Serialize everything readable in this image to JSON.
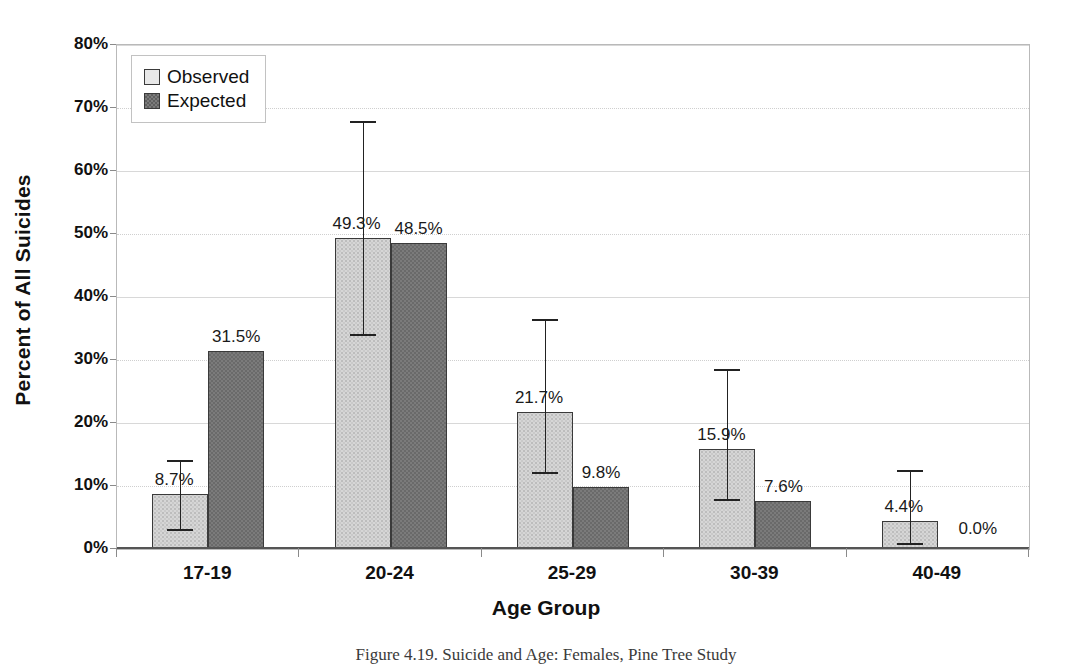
{
  "chart_data": {
    "type": "bar",
    "title": "",
    "xlabel": "Age Group",
    "ylabel": "Percent of All Suicides",
    "ylim": [
      0,
      80
    ],
    "ytick_labels": [
      "0%",
      "10%",
      "20%",
      "30%",
      "40%",
      "50%",
      "60%",
      "70%",
      "80%"
    ],
    "ytick_values": [
      0,
      10,
      20,
      30,
      40,
      50,
      60,
      70,
      80
    ],
    "grid": true,
    "legend_position": "top-left",
    "categories": [
      "17-19",
      "20-24",
      "25-29",
      "30-39",
      "40-49"
    ],
    "series": [
      {
        "name": "Observed",
        "color": "#d6d6d6",
        "values": [
          8.7,
          49.3,
          21.7,
          15.9,
          4.4
        ],
        "labels": [
          "8.7%",
          "49.3%",
          "21.7%",
          "15.9%",
          "4.4%"
        ],
        "error_low": [
          3.2,
          34.2,
          12.2,
          8.0,
          1.0
        ],
        "error_high": [
          14.2,
          68.0,
          36.5,
          28.5,
          12.5
        ]
      },
      {
        "name": "Expected",
        "color": "#7b7b7b",
        "values": [
          31.5,
          48.5,
          9.8,
          7.6,
          0.0
        ],
        "labels": [
          "31.5%",
          "48.5%",
          "9.8%",
          "7.6%",
          "0.0%"
        ],
        "error_low": [
          null,
          null,
          null,
          null,
          null
        ],
        "error_high": [
          null,
          null,
          null,
          null,
          null
        ]
      }
    ]
  },
  "legend": {
    "items": [
      {
        "label": "Observed",
        "swatch": "observed"
      },
      {
        "label": "Expected",
        "swatch": "expected"
      }
    ]
  },
  "caption": {
    "text": "Figure 4.19. Suicide and Age: Females, Pine Tree Study"
  }
}
